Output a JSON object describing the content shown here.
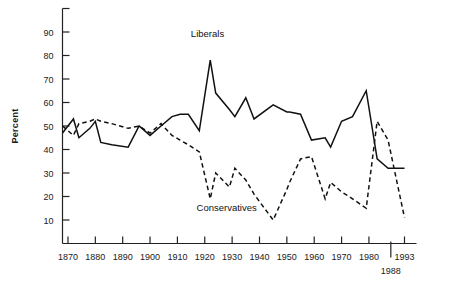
{
  "chart_data": {
    "type": "line",
    "title": "",
    "xlabel": "",
    "ylabel": "Percent",
    "xlim": [
      1865,
      1995
    ],
    "ylim": [
      0,
      100
    ],
    "grid": false,
    "legend_position": "inline-annotation",
    "xticks": [
      "1870",
      "1880",
      "1890",
      "1900",
      "1910",
      "1920",
      "1930",
      "1940",
      "1950",
      "1960",
      "1970",
      "1980",
      "1993"
    ],
    "xtick_values": [
      1870,
      1880,
      1890,
      1900,
      1910,
      1920,
      1930,
      1940,
      1950,
      1960,
      1970,
      1980,
      1993
    ],
    "extra_xticks": [
      "1988"
    ],
    "extra_xtick_values": [
      1988
    ],
    "yticks": [
      "10",
      "20",
      "30",
      "40",
      "50",
      "60",
      "70",
      "80",
      "90"
    ],
    "ytick_values": [
      10,
      20,
      30,
      40,
      50,
      60,
      70,
      80,
      90
    ],
    "series": [
      {
        "name": "Liberals",
        "style": "solid",
        "color": "#111111",
        "label_x": 1921,
        "label_y": 88,
        "points": [
          [
            1868,
            47
          ],
          [
            1872,
            53
          ],
          [
            1874,
            45
          ],
          [
            1878,
            49
          ],
          [
            1880,
            52
          ],
          [
            1882,
            43
          ],
          [
            1886,
            42
          ],
          [
            1892,
            41
          ],
          [
            1896,
            50
          ],
          [
            1900,
            46
          ],
          [
            1904,
            50
          ],
          [
            1908,
            54
          ],
          [
            1911,
            55
          ],
          [
            1914,
            55
          ],
          [
            1918,
            48
          ],
          [
            1922,
            78
          ],
          [
            1924,
            64
          ],
          [
            1929,
            57
          ],
          [
            1931,
            54
          ],
          [
            1935,
            62
          ],
          [
            1938,
            53
          ],
          [
            1945,
            59
          ],
          [
            1950,
            56
          ],
          [
            1951,
            56
          ],
          [
            1955,
            55
          ],
          [
            1959,
            44
          ],
          [
            1964,
            45
          ],
          [
            1966,
            41
          ],
          [
            1970,
            52
          ],
          [
            1974,
            54
          ],
          [
            1979,
            65
          ],
          [
            1983,
            36
          ],
          [
            1987,
            32
          ],
          [
            1993,
            32
          ]
        ]
      },
      {
        "name": "Conservatives",
        "style": "dashed",
        "color": "#111111",
        "label_x": 1928,
        "label_y": 14,
        "points": [
          [
            1868,
            50
          ],
          [
            1872,
            46
          ],
          [
            1874,
            51
          ],
          [
            1878,
            52
          ],
          [
            1880,
            53
          ],
          [
            1882,
            52
          ],
          [
            1886,
            51
          ],
          [
            1892,
            49
          ],
          [
            1896,
            50
          ],
          [
            1900,
            47
          ],
          [
            1904,
            51
          ],
          [
            1908,
            46
          ],
          [
            1911,
            44
          ],
          [
            1914,
            42
          ],
          [
            1918,
            39
          ],
          [
            1922,
            19
          ],
          [
            1924,
            30
          ],
          [
            1929,
            24
          ],
          [
            1931,
            32
          ],
          [
            1935,
            27
          ],
          [
            1938,
            21
          ],
          [
            1945,
            10
          ],
          [
            1950,
            23
          ],
          [
            1951,
            26
          ],
          [
            1955,
            36
          ],
          [
            1959,
            37
          ],
          [
            1964,
            19
          ],
          [
            1966,
            26
          ],
          [
            1970,
            22
          ],
          [
            1974,
            19
          ],
          [
            1979,
            15
          ],
          [
            1983,
            52
          ],
          [
            1987,
            44
          ],
          [
            1993,
            11
          ]
        ]
      }
    ]
  }
}
